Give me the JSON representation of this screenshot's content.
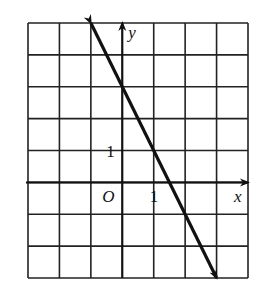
{
  "chart_data": {
    "type": "line",
    "title": "",
    "xlabel": "x",
    "ylabel": "y",
    "origin_label": "O",
    "xlim": [
      -3,
      4
    ],
    "ylim": [
      -3,
      5
    ],
    "grid": true,
    "x_tick_labels": [
      {
        "value": 1,
        "label": "1"
      }
    ],
    "y_tick_labels": [
      {
        "value": 1,
        "label": "1"
      }
    ],
    "series": [
      {
        "name": "y = -2x + 3",
        "equation": "y = -2x + 3",
        "points": [
          [
            -1,
            5
          ],
          [
            0,
            3
          ],
          [
            1,
            1
          ],
          [
            3,
            -3
          ]
        ],
        "arrows": "both"
      }
    ]
  },
  "labels": {
    "x_axis": "x",
    "y_axis": "y",
    "origin": "O",
    "x_tick": "1",
    "y_tick": "1"
  }
}
